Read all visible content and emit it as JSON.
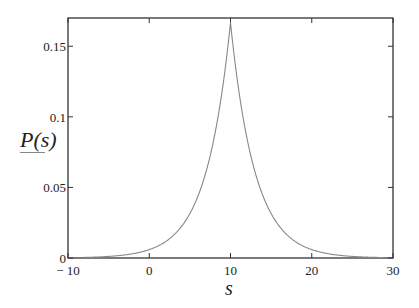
{
  "chart_data": {
    "type": "line",
    "title": "",
    "xlabel": "s",
    "ylabel": "P(s)",
    "xlim": [
      -10,
      30
    ],
    "ylim": [
      0,
      0.17
    ],
    "x_ticks": [
      -10,
      0,
      10,
      20,
      30
    ],
    "x_tick_labels": [
      "− 10",
      "0",
      "10",
      "20",
      "30"
    ],
    "y_ticks": [
      0,
      0.05,
      0.1,
      0.15
    ],
    "y_tick_labels": [
      "0",
      "0.05",
      "0.1",
      "0.15"
    ],
    "grid": false,
    "legend": null,
    "series": [
      {
        "name": "P(s)",
        "color": "#888888",
        "description": "Laplace-shaped density peaked at s=10",
        "x": [
          -8,
          -5,
          -2,
          0,
          2,
          4,
          6,
          8,
          9,
          10,
          11,
          12,
          14,
          16,
          18,
          20,
          22,
          25,
          29
        ],
        "y": [
          0.0004,
          0.0011,
          0.0031,
          0.0059,
          0.0117,
          0.0226,
          0.0439,
          0.0856,
          0.1194,
          0.1667,
          0.1194,
          0.0856,
          0.0439,
          0.0226,
          0.0117,
          0.0059,
          0.0031,
          0.0011,
          0.0003
        ]
      }
    ]
  },
  "axes": {
    "x_label": "s",
    "y_label": "P(s)"
  }
}
